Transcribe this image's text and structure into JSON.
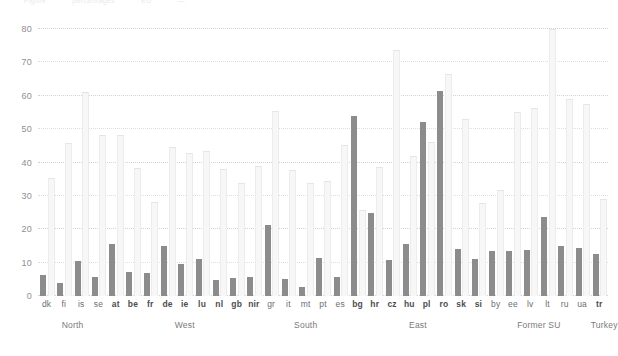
{
  "title_fragments": [
    "Figure",
    "percentages",
    "EU",
    "—"
  ],
  "chart_data": {
    "type": "bar",
    "title": "",
    "xlabel": "",
    "ylabel": "",
    "ylim": [
      0,
      80
    ],
    "yticks": [
      0,
      10,
      20,
      30,
      40,
      50,
      60,
      70,
      80
    ],
    "grid": true,
    "legend": "none",
    "categories": [
      "dk",
      "fi",
      "is",
      "se",
      "at",
      "be",
      "fr",
      "de",
      "ie",
      "lu",
      "nl",
      "gb",
      "nir",
      "gr",
      "it",
      "mt",
      "pt",
      "es",
      "bg",
      "hr",
      "cz",
      "hu",
      "pl",
      "ro",
      "sk",
      "si",
      "by",
      "ee",
      "lv",
      "lt",
      "ru",
      "ua",
      "tr"
    ],
    "category_bold": [
      false,
      false,
      false,
      false,
      true,
      true,
      true,
      true,
      true,
      true,
      true,
      true,
      true,
      false,
      false,
      false,
      false,
      false,
      true,
      true,
      true,
      true,
      true,
      true,
      true,
      true,
      false,
      false,
      false,
      false,
      false,
      false,
      true
    ],
    "series": [
      {
        "name": "background",
        "color": "#f7f7f7",
        "values": [
          35.2,
          45.6,
          60.8,
          47.8,
          47.9,
          38.2,
          27.8,
          44.3,
          42.5,
          43.3,
          37.9,
          33.5,
          38.8,
          55.2,
          37.4,
          33.6,
          34.2,
          45.0,
          25.6,
          38.5,
          73.4,
          41.8,
          45.7,
          66.3,
          52.7,
          27.5,
          31.5,
          54.7,
          56.0,
          79.8,
          58.8,
          57.2,
          28.9
        ]
      },
      {
        "name": "foreground",
        "color": "#8c8c8c",
        "values": [
          6.3,
          4.0,
          10.5,
          5.8,
          15.5,
          7.3,
          6.8,
          14.9,
          9.6,
          11.2,
          4.8,
          5.4,
          5.7,
          21.4,
          5.2,
          2.7,
          11.3,
          5.6,
          53.9,
          24.8,
          10.7,
          15.7,
          52.2,
          61.3,
          14.1,
          11.2,
          13.4,
          13.6,
          13.8,
          23.8,
          15.0,
          14.3,
          12.7
        ]
      }
    ],
    "groups": [
      {
        "label": "North",
        "start": 0,
        "end": 3
      },
      {
        "label": "West",
        "start": 4,
        "end": 12
      },
      {
        "label": "South",
        "start": 13,
        "end": 17
      },
      {
        "label": "East",
        "start": 18,
        "end": 25
      },
      {
        "label": "Former SU",
        "start": 26,
        "end": 31
      },
      {
        "label": "Turkey",
        "start": 32,
        "end": 32
      }
    ]
  }
}
